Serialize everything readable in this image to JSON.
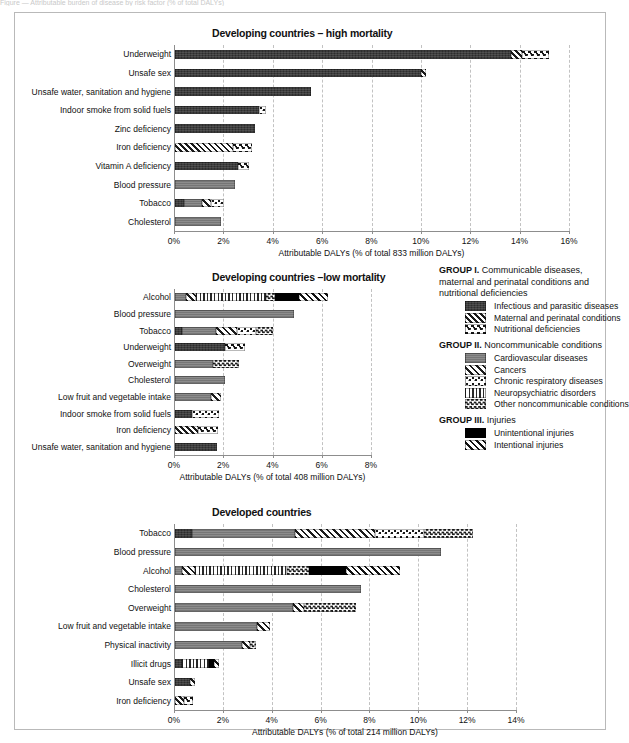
{
  "page": {
    "cropped_header": "Figure — Attributable burden of disease by risk factor (% of total DALYs)"
  },
  "legend": {
    "groups": [
      {
        "name": "legend-group-1",
        "heading_bold": "GROUP I.",
        "heading_rest": " Communicable diseases, maternal and perinatal conditions and nutritional deficiencies",
        "items": [
          {
            "label": "Infectious and parasitic diseases",
            "pattern": "p-infect"
          },
          {
            "label": "Maternal and perinatal conditions",
            "pattern": "p-maternal"
          },
          {
            "label": "Nutritional deficiencies",
            "pattern": "p-nutri"
          }
        ]
      },
      {
        "name": "legend-group-2",
        "heading_bold": "GROUP II.",
        "heading_rest": " Noncommunicable conditions",
        "items": [
          {
            "label": "Cardiovascular diseases",
            "pattern": "p-cardio"
          },
          {
            "label": "Cancers",
            "pattern": "p-cancer"
          },
          {
            "label": "Chronic respiratory diseases",
            "pattern": "p-resp"
          },
          {
            "label": "Neuropsychiatric disorders",
            "pattern": "p-neuro"
          },
          {
            "label": "Other noncommunicable conditions",
            "pattern": "p-othernc"
          }
        ]
      },
      {
        "name": "legend-group-3",
        "heading_bold": "GROUP III.",
        "heading_rest": " Injuries",
        "items": [
          {
            "label": "Unintentional injuries",
            "pattern": "p-unint"
          },
          {
            "label": "Intentional injuries",
            "pattern": "p-int"
          }
        ]
      }
    ]
  },
  "chart_data": [
    {
      "id": "chart-high-mortality",
      "type": "bar",
      "orientation": "horizontal",
      "stacked": true,
      "title": "Developing countries – high mortality",
      "xlabel": "Attributable DALYs (% of total 833 million DALYs)",
      "ylabel": "",
      "xlim": [
        0,
        16
      ],
      "xticks": [
        0,
        2,
        4,
        6,
        8,
        10,
        12,
        14,
        16
      ],
      "xticklabels": [
        "0%",
        "2%",
        "4%",
        "6%",
        "8%",
        "10%",
        "12%",
        "14%",
        "16%"
      ],
      "grid": true,
      "categories": [
        "Underweight",
        "Unsafe sex",
        "Unsafe water, sanitation and hygiene",
        "Indoor smoke from solid fuels",
        "Zinc deficiency",
        "Iron deficiency",
        "Vitamin A deficiency",
        "Blood pressure",
        "Tobacco",
        "Cholesterol"
      ],
      "totals": [
        15.15,
        10.15,
        5.5,
        3.7,
        3.25,
        3.1,
        3.0,
        2.45,
        2.0,
        1.85
      ],
      "bars": [
        {
          "category": "Underweight",
          "total": 15.15,
          "segments": [
            {
              "series": "Infectious and parasitic diseases",
              "pattern": "p-infect",
              "value": 13.6
            },
            {
              "series": "Maternal and perinatal conditions",
              "pattern": "p-maternal",
              "value": 0.45
            },
            {
              "series": "Nutritional deficiencies",
              "pattern": "p-nutri",
              "value": 1.1
            }
          ]
        },
        {
          "category": "Unsafe sex",
          "total": 10.15,
          "segments": [
            {
              "series": "Infectious and parasitic diseases",
              "pattern": "p-infect",
              "value": 9.95
            },
            {
              "series": "Maternal and perinatal conditions",
              "pattern": "p-maternal",
              "value": 0.2
            }
          ]
        },
        {
          "category": "Unsafe water, sanitation and hygiene",
          "total": 5.5,
          "segments": [
            {
              "series": "Infectious and parasitic diseases",
              "pattern": "p-infect",
              "value": 5.5
            }
          ]
        },
        {
          "category": "Indoor smoke from solid fuels",
          "total": 3.7,
          "segments": [
            {
              "series": "Infectious and parasitic diseases",
              "pattern": "p-infect",
              "value": 3.4
            },
            {
              "series": "Chronic respiratory diseases",
              "pattern": "p-resp",
              "value": 0.3
            }
          ]
        },
        {
          "category": "Zinc deficiency",
          "total": 3.25,
          "segments": [
            {
              "series": "Infectious and parasitic diseases",
              "pattern": "p-infect",
              "value": 3.25
            }
          ]
        },
        {
          "category": "Iron deficiency",
          "total": 3.1,
          "segments": [
            {
              "series": "Maternal and perinatal conditions",
              "pattern": "p-maternal",
              "value": 2.35
            },
            {
              "series": "Nutritional deficiencies",
              "pattern": "p-nutri",
              "value": 0.75
            }
          ]
        },
        {
          "category": "Vitamin A deficiency",
          "total": 3.0,
          "segments": [
            {
              "series": "Infectious and parasitic diseases",
              "pattern": "p-infect",
              "value": 2.55
            },
            {
              "series": "Nutritional deficiencies",
              "pattern": "p-nutri",
              "value": 0.45
            }
          ]
        },
        {
          "category": "Blood pressure",
          "total": 2.45,
          "segments": [
            {
              "series": "Cardiovascular diseases",
              "pattern": "p-cardio",
              "value": 2.45
            }
          ]
        },
        {
          "category": "Tobacco",
          "total": 2.0,
          "segments": [
            {
              "series": "Infectious and parasitic diseases",
              "pattern": "p-infect",
              "value": 0.35
            },
            {
              "series": "Cardiovascular diseases",
              "pattern": "p-cardio",
              "value": 0.75
            },
            {
              "series": "Cancers",
              "pattern": "p-cancer",
              "value": 0.35
            },
            {
              "series": "Chronic respiratory diseases",
              "pattern": "p-resp",
              "value": 0.55
            }
          ]
        },
        {
          "category": "Cholesterol",
          "total": 1.85,
          "segments": [
            {
              "series": "Cardiovascular diseases",
              "pattern": "p-cardio",
              "value": 1.85
            }
          ]
        }
      ]
    },
    {
      "id": "chart-low-mortality",
      "type": "bar",
      "orientation": "horizontal",
      "stacked": true,
      "title": "Developing countries –low mortality",
      "xlabel": "Attributable DALYs (% of total 408 million DALYs)",
      "ylabel": "",
      "xlim": [
        0,
        8
      ],
      "xticks": [
        0,
        2,
        4,
        6,
        8
      ],
      "xticklabels": [
        "0%",
        "2%",
        "4%",
        "6%",
        "8%"
      ],
      "grid": true,
      "categories": [
        "Alcohol",
        "Blood pressure",
        "Tobacco",
        "Underweight",
        "Overweight",
        "Cholesterol",
        "Low fruit and vegetable intake",
        "Indoor smoke from solid fuels",
        "Iron deficiency",
        "Unsafe water, sanitation and hygiene"
      ],
      "totals": [
        6.2,
        4.85,
        4.0,
        2.85,
        2.6,
        2.05,
        1.85,
        1.8,
        1.75,
        1.7
      ],
      "bars": [
        {
          "category": "Alcohol",
          "total": 6.2,
          "segments": [
            {
              "series": "Cardiovascular diseases",
              "pattern": "p-cardio",
              "value": 0.45
            },
            {
              "series": "Cancers",
              "pattern": "p-cancer",
              "value": 0.4
            },
            {
              "series": "Neuropsychiatric disorders",
              "pattern": "p-neuro",
              "value": 2.85
            },
            {
              "series": "Other noncommunicable conditions",
              "pattern": "p-othernc",
              "value": 0.35
            },
            {
              "series": "Unintentional injuries",
              "pattern": "p-unint",
              "value": 1.0
            },
            {
              "series": "Intentional injuries",
              "pattern": "p-int",
              "value": 1.15
            }
          ]
        },
        {
          "category": "Blood pressure",
          "total": 4.85,
          "segments": [
            {
              "series": "Cardiovascular diseases",
              "pattern": "p-cardio",
              "value": 4.85
            }
          ]
        },
        {
          "category": "Tobacco",
          "total": 4.0,
          "segments": [
            {
              "series": "Infectious and parasitic diseases",
              "pattern": "p-infect",
              "value": 0.3
            },
            {
              "series": "Cardiovascular diseases",
              "pattern": "p-cardio",
              "value": 1.35
            },
            {
              "series": "Cancers",
              "pattern": "p-cancer",
              "value": 0.85
            },
            {
              "series": "Chronic respiratory diseases",
              "pattern": "p-resp",
              "value": 0.8
            },
            {
              "series": "Other noncommunicable conditions",
              "pattern": "p-othernc",
              "value": 0.7
            }
          ]
        },
        {
          "category": "Underweight",
          "total": 2.85,
          "segments": [
            {
              "series": "Infectious and parasitic diseases",
              "pattern": "p-infect",
              "value": 2.05
            },
            {
              "series": "Nutritional deficiencies",
              "pattern": "p-nutri",
              "value": 0.8
            }
          ]
        },
        {
          "category": "Overweight",
          "total": 2.6,
          "segments": [
            {
              "series": "Cardiovascular diseases",
              "pattern": "p-cardio",
              "value": 1.55
            },
            {
              "series": "Other noncommunicable conditions",
              "pattern": "p-othernc",
              "value": 1.05
            }
          ]
        },
        {
          "category": "Cholesterol",
          "total": 2.05,
          "segments": [
            {
              "series": "Cardiovascular diseases",
              "pattern": "p-cardio",
              "value": 2.05
            }
          ]
        },
        {
          "category": "Low fruit and vegetable intake",
          "total": 1.85,
          "segments": [
            {
              "series": "Cardiovascular diseases",
              "pattern": "p-cardio",
              "value": 1.45
            },
            {
              "series": "Cancers",
              "pattern": "p-cancer",
              "value": 0.4
            }
          ]
        },
        {
          "category": "Indoor smoke from solid fuels",
          "total": 1.8,
          "segments": [
            {
              "series": "Infectious and parasitic diseases",
              "pattern": "p-infect",
              "value": 0.7
            },
            {
              "series": "Chronic respiratory diseases",
              "pattern": "p-resp",
              "value": 1.1
            }
          ]
        },
        {
          "category": "Iron deficiency",
          "total": 1.75,
          "segments": [
            {
              "series": "Maternal and perinatal conditions",
              "pattern": "p-maternal",
              "value": 0.95
            },
            {
              "series": "Nutritional deficiencies",
              "pattern": "p-nutri",
              "value": 0.8
            }
          ]
        },
        {
          "category": "Unsafe water, sanitation and hygiene",
          "total": 1.7,
          "segments": [
            {
              "series": "Infectious and parasitic diseases",
              "pattern": "p-infect",
              "value": 1.7
            }
          ]
        }
      ]
    },
    {
      "id": "chart-developed",
      "type": "bar",
      "orientation": "horizontal",
      "stacked": true,
      "title": "Developed countries",
      "xlabel": "Attributable DALYs (% of total 214 million DALYs)",
      "ylabel": "",
      "xlim": [
        0,
        14
      ],
      "xticks": [
        0,
        2,
        4,
        6,
        8,
        10,
        12,
        14
      ],
      "xticklabels": [
        "0%",
        "2%",
        "4%",
        "6%",
        "8%",
        "10%",
        "12%",
        "14%"
      ],
      "grid": true,
      "categories": [
        "Tobacco",
        "Blood pressure",
        "Alcohol",
        "Cholesterol",
        "Overweight",
        "Low fruit and vegetable intake",
        "Physical inactivity",
        "Illicit drugs",
        "Unsafe sex",
        "Iron deficiency"
      ],
      "totals": [
        12.2,
        10.9,
        9.2,
        7.6,
        7.4,
        3.9,
        3.3,
        1.8,
        0.8,
        0.75
      ],
      "bars": [
        {
          "category": "Tobacco",
          "total": 12.2,
          "segments": [
            {
              "series": "Infectious and parasitic diseases",
              "pattern": "p-infect",
              "value": 0.7
            },
            {
              "series": "Cardiovascular diseases",
              "pattern": "p-cardio",
              "value": 4.2
            },
            {
              "series": "Cancers",
              "pattern": "p-cancer",
              "value": 3.3
            },
            {
              "series": "Chronic respiratory diseases",
              "pattern": "p-resp",
              "value": 2.0
            },
            {
              "series": "Other noncommunicable conditions",
              "pattern": "p-othernc",
              "value": 2.0
            }
          ]
        },
        {
          "category": "Blood pressure",
          "total": 10.9,
          "segments": [
            {
              "series": "Cardiovascular diseases",
              "pattern": "p-cardio",
              "value": 10.9
            }
          ]
        },
        {
          "category": "Alcohol",
          "total": 9.2,
          "segments": [
            {
              "series": "Cardiovascular diseases",
              "pattern": "p-cardio",
              "value": 0.3
            },
            {
              "series": "Cancers",
              "pattern": "p-cancer",
              "value": 0.5
            },
            {
              "series": "Neuropsychiatric disorders",
              "pattern": "p-neuro",
              "value": 3.8
            },
            {
              "series": "Other noncommunicable conditions",
              "pattern": "p-othernc",
              "value": 0.9
            },
            {
              "series": "Unintentional injuries",
              "pattern": "p-unint",
              "value": 1.5
            },
            {
              "series": "Intentional injuries",
              "pattern": "p-int",
              "value": 2.2
            }
          ]
        },
        {
          "category": "Cholesterol",
          "total": 7.6,
          "segments": [
            {
              "series": "Cardiovascular diseases",
              "pattern": "p-cardio",
              "value": 7.6
            }
          ]
        },
        {
          "category": "Overweight",
          "total": 7.4,
          "segments": [
            {
              "series": "Cardiovascular diseases",
              "pattern": "p-cardio",
              "value": 4.85
            },
            {
              "series": "Cancers",
              "pattern": "p-cancer",
              "value": 0.45
            },
            {
              "series": "Other noncommunicable conditions",
              "pattern": "p-othernc",
              "value": 2.1
            }
          ]
        },
        {
          "category": "Low fruit and vegetable intake",
          "total": 3.9,
          "segments": [
            {
              "series": "Cardiovascular diseases",
              "pattern": "p-cardio",
              "value": 3.35
            },
            {
              "series": "Cancers",
              "pattern": "p-cancer",
              "value": 0.55
            }
          ]
        },
        {
          "category": "Physical inactivity",
          "total": 3.3,
          "segments": [
            {
              "series": "Cardiovascular diseases",
              "pattern": "p-cardio",
              "value": 2.75
            },
            {
              "series": "Cancers",
              "pattern": "p-cancer",
              "value": 0.3
            },
            {
              "series": "Other noncommunicable conditions",
              "pattern": "p-othernc",
              "value": 0.25
            }
          ]
        },
        {
          "category": "Illicit drugs",
          "total": 1.8,
          "segments": [
            {
              "series": "Infectious and parasitic diseases",
              "pattern": "p-infect",
              "value": 0.3
            },
            {
              "series": "Neuropsychiatric disorders",
              "pattern": "p-neuro",
              "value": 1.1
            },
            {
              "series": "Unintentional injuries",
              "pattern": "p-unint",
              "value": 0.2
            },
            {
              "series": "Intentional injuries",
              "pattern": "p-int",
              "value": 0.2
            }
          ]
        },
        {
          "category": "Unsafe sex",
          "total": 0.8,
          "segments": [
            {
              "series": "Infectious and parasitic diseases",
              "pattern": "p-infect",
              "value": 0.6
            },
            {
              "series": "Cancers",
              "pattern": "p-cancer",
              "value": 0.2
            }
          ]
        },
        {
          "category": "Iron deficiency",
          "total": 0.75,
          "segments": [
            {
              "series": "Maternal and perinatal conditions",
              "pattern": "p-maternal",
              "value": 0.35
            },
            {
              "series": "Nutritional deficiencies",
              "pattern": "p-nutri",
              "value": 0.4
            }
          ]
        }
      ]
    }
  ]
}
